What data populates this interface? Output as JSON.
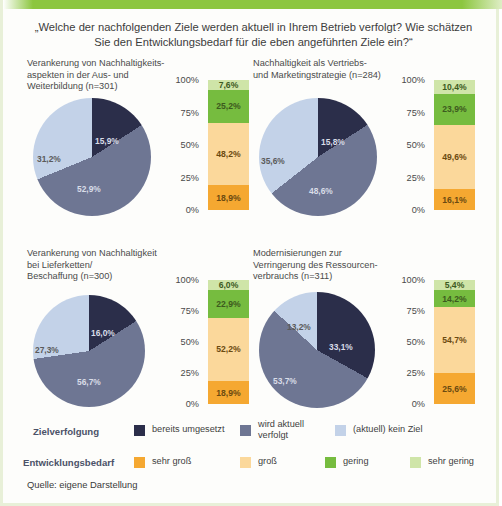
{
  "header": {
    "question": "„Welche der nachfolgenden Ziele werden aktuell in Ihrem Betrieb verfolgt? Wie schätzen Sie den Entwicklungsbedarf für die eben angeführten Ziele ein?“"
  },
  "axis_labels": [
    "100%",
    "75%",
    "50%",
    "25%",
    "0%"
  ],
  "legend": {
    "row1_caption": "Zielverfolgung",
    "row1_items": [
      {
        "label": "bereits umgesetzt",
        "color": "#2b2e4a"
      },
      {
        "label": "wird aktuell\nverfolgt",
        "color": "#6e7693"
      },
      {
        "label": "(aktuell) kein Ziel",
        "color": "#c3d2e8"
      }
    ],
    "row2_caption": "Entwicklungsbedarf",
    "row2_items": [
      {
        "label": "sehr groß",
        "color": "#f5a831"
      },
      {
        "label": "groß",
        "color": "#fbd89b"
      },
      {
        "label": "gering",
        "color": "#76bc3f"
      },
      {
        "label": "sehr gering",
        "color": "#cfe5a8"
      }
    ]
  },
  "source": "Quelle: eigene Darstellung",
  "chart_data": [
    {
      "type": "pie",
      "title": "Verankerung von Nachhaltigkeits-\naspekten in der Aus- und\nWeiterbildung (n=301)",
      "n": 301,
      "categories": [
        "bereits umgesetzt",
        "wird aktuell verfolgt",
        "(aktuell) kein Ziel"
      ],
      "values": [
        15.9,
        52.9,
        31.2
      ],
      "labels": [
        "15,9%",
        "52,9%",
        "31,2%"
      ],
      "colors": [
        "#2b2e4a",
        "#6e7693",
        "#c3d2e8"
      ]
    },
    {
      "type": "bar",
      "stacked": true,
      "title": "Entwicklungsbedarf Aus- und Weiterbildung",
      "categories": [
        "sehr groß",
        "groß",
        "gering",
        "sehr gering"
      ],
      "values": [
        18.9,
        48.2,
        25.2,
        7.6
      ],
      "labels": [
        "18,9%",
        "48,2%",
        "25,2%",
        "7,6%"
      ],
      "colors": [
        "#f5a831",
        "#fbd89b",
        "#76bc3f",
        "#cfe5a8"
      ],
      "ylim": [
        0,
        100
      ],
      "yticks": [
        "0%",
        "25%",
        "50%",
        "75%",
        "100%"
      ]
    },
    {
      "type": "pie",
      "title": "Nachhaltigkeit als Vertriebs-\nund Marketingstrategie (n=284)",
      "n": 284,
      "categories": [
        "bereits umgesetzt",
        "wird aktuell verfolgt",
        "(aktuell) kein Ziel"
      ],
      "values": [
        15.8,
        48.6,
        35.6
      ],
      "labels": [
        "15,8%",
        "48,6%",
        "35,6%"
      ],
      "colors": [
        "#2b2e4a",
        "#6e7693",
        "#c3d2e8"
      ]
    },
    {
      "type": "bar",
      "stacked": true,
      "title": "Entwicklungsbedarf Vertriebs- und Marketingstrategie",
      "categories": [
        "sehr groß",
        "groß",
        "gering",
        "sehr gering"
      ],
      "values": [
        16.1,
        49.6,
        23.9,
        10.4
      ],
      "labels": [
        "16,1%",
        "49,6%",
        "23,9%",
        "10,4%"
      ],
      "colors": [
        "#f5a831",
        "#fbd89b",
        "#76bc3f",
        "#cfe5a8"
      ],
      "ylim": [
        0,
        100
      ],
      "yticks": [
        "0%",
        "25%",
        "50%",
        "75%",
        "100%"
      ]
    },
    {
      "type": "pie",
      "title": "Verankerung von Nachhaltigkeit\nbei Lieferketten/\nBeschaffung (n=300)",
      "n": 300,
      "categories": [
        "bereits umgesetzt",
        "wird aktuell verfolgt",
        "(aktuell) kein Ziel"
      ],
      "values": [
        16.0,
        56.7,
        27.3
      ],
      "labels": [
        "16,0%",
        "56,7%",
        "27,3%"
      ],
      "colors": [
        "#2b2e4a",
        "#6e7693",
        "#c3d2e8"
      ]
    },
    {
      "type": "bar",
      "stacked": true,
      "title": "Entwicklungsbedarf Lieferketten/Beschaffung",
      "categories": [
        "sehr groß",
        "groß",
        "gering",
        "sehr gering"
      ],
      "values": [
        18.9,
        52.2,
        22.9,
        6.0
      ],
      "labels": [
        "18,9%",
        "52,2%",
        "22,9%",
        "6,0%"
      ],
      "colors": [
        "#f5a831",
        "#fbd89b",
        "#76bc3f",
        "#cfe5a8"
      ],
      "ylim": [
        0,
        100
      ],
      "yticks": [
        "0%",
        "25%",
        "50%",
        "75%",
        "100%"
      ]
    },
    {
      "type": "pie",
      "title": "Modernisierungen zur\nVerringerung des Ressourcen-\nverbrauchs (n=311)",
      "n": 311,
      "categories": [
        "bereits umgesetzt",
        "wird aktuell verfolgt",
        "(aktuell) kein Ziel"
      ],
      "values": [
        33.1,
        53.7,
        13.2
      ],
      "labels": [
        "33,1%",
        "53,7%",
        "13,2%"
      ],
      "colors": [
        "#2b2e4a",
        "#6e7693",
        "#c3d2e8"
      ]
    },
    {
      "type": "bar",
      "stacked": true,
      "title": "Entwicklungsbedarf Ressourcenverbrauch",
      "categories": [
        "sehr groß",
        "groß",
        "gering",
        "sehr gering"
      ],
      "values": [
        25.6,
        54.7,
        14.2,
        5.4
      ],
      "labels": [
        "25,6%",
        "54,7%",
        "14,2%",
        "5,4%"
      ],
      "colors": [
        "#f5a831",
        "#fbd89b",
        "#76bc3f",
        "#cfe5a8"
      ],
      "ylim": [
        0,
        100
      ],
      "yticks": [
        "0%",
        "25%",
        "50%",
        "75%",
        "100%"
      ]
    }
  ]
}
